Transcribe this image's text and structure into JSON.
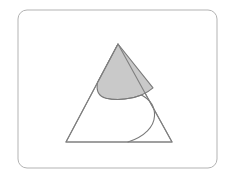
{
  "figure": {
    "title": "Triangle with shaded curved region",
    "canvas": {
      "width": 233,
      "height": 178,
      "background": "#ffffff"
    },
    "frame": {
      "name": "rounded-rectangle-border",
      "x": 18,
      "y": 10,
      "width": 199,
      "height": 158,
      "corner_radius": 9,
      "stroke": "#b3b3b3",
      "stroke_width": 1,
      "fill": "none"
    },
    "triangle": {
      "name": "outline-triangle",
      "apex": [
        118,
        44
      ],
      "bottom_left": [
        66,
        142
      ],
      "bottom_right": [
        172,
        142
      ],
      "stroke": "#808080",
      "stroke_width": 1.1,
      "fill": "none",
      "points": "118,44 66,142 172,142"
    },
    "shaded_region": {
      "name": "shaded-curved-region",
      "fill": "#c9c9c9",
      "stroke": "#7a7a7a",
      "stroke_width": 1.1,
      "description": "Region bounded above by the two upper sides of the triangle meeting at the apex, and below by an S-shaped curve running from the left side to the right side.",
      "path": "M 118 44 L 97.5 82.5 C 96.0 91.0 99.0 96.5 106.0 98.2 C 118.0 100.8 132.0 99.0 141.5 95.0 C 147.0 92.6 150.5 90.0 153.0 87.8 L 153.0 87.8 Z",
      "anchor_left_on_triangle": [
        97.5,
        82.5
      ],
      "anchor_right_on_triangle": [
        153.0,
        87.8
      ]
    },
    "lower_curve": {
      "name": "lower-boundary-curve",
      "stroke": "#7a7a7a",
      "stroke_width": 1.1,
      "fill": "none",
      "description": "Curve continuing from the right anchor of the shaded region, bowing outward to the right and descending to the triangle base.",
      "path": "M 106.0 98.2 C 118.0 100.8 132.0 99.0 141.5 95.0 C 150.0 99.5 155.0 107.0 154.5 116.0 C 154.0 126.5 145.0 136.5 128.0 142.0",
      "base_intersection": [
        128,
        142
      ]
    }
  },
  "colors": {
    "frame_stroke": "#b3b3b3",
    "triangle_stroke": "#808080",
    "curve_stroke": "#7a7a7a",
    "region_fill": "#c9c9c9",
    "background": "#ffffff"
  }
}
